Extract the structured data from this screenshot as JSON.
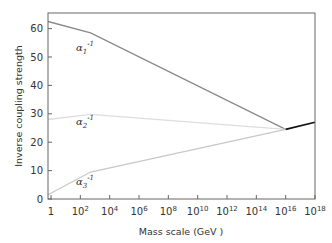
{
  "chart_data": {
    "type": "line",
    "title": "",
    "xlabel": "Mass scale (GeV )",
    "ylabel": "Inverse coupling strength",
    "xscale": "log10",
    "xlim_log10": [
      0,
      18
    ],
    "ylim": [
      0,
      65.5
    ],
    "x_ticks": [
      {
        "exp": 0,
        "label": "1",
        "sup": ""
      },
      {
        "exp": 2,
        "label": "10",
        "sup": "2"
      },
      {
        "exp": 4,
        "label": "10",
        "sup": "4"
      },
      {
        "exp": 6,
        "label": "10",
        "sup": "6"
      },
      {
        "exp": 8,
        "label": "10",
        "sup": "8"
      },
      {
        "exp": 10,
        "label": "10",
        "sup": "10"
      },
      {
        "exp": 12,
        "label": "10",
        "sup": "12"
      },
      {
        "exp": 14,
        "label": "10",
        "sup": "14"
      },
      {
        "exp": 16,
        "label": "10",
        "sup": "16"
      },
      {
        "exp": 18,
        "label": "10",
        "sup": "18"
      }
    ],
    "y_ticks": [
      0,
      10,
      20,
      30,
      40,
      50,
      60
    ],
    "grid": false,
    "legend": "inline labels",
    "series": [
      {
        "name": "alpha1_inverse",
        "label_base": "α",
        "label_sub": "1",
        "label_sup": "-1",
        "color": "#8a8a8a",
        "x_log10": [
          0,
          2.7,
          16
        ],
        "values": [
          62.5,
          58.5,
          24.5
        ],
        "label_pos": {
          "x_log10": 1.7,
          "y": 52
        }
      },
      {
        "name": "alpha2_inverse",
        "label_base": "α",
        "label_sub": "2",
        "label_sup": "-1",
        "color": "#dedede",
        "x_log10": [
          0,
          2.7,
          16
        ],
        "values": [
          28,
          29.8,
          24.5
        ],
        "label_pos": {
          "x_log10": 1.7,
          "y": 26
        }
      },
      {
        "name": "alpha3_inverse",
        "label_base": "α",
        "label_sub": "3",
        "label_sup": "-1",
        "color": "#c8c8c8",
        "x_log10": [
          0,
          2.7,
          16
        ],
        "values": [
          1.5,
          9.5,
          24.5
        ],
        "label_pos": {
          "x_log10": 1.7,
          "y": 5
        }
      },
      {
        "name": "unified",
        "color": "#111111",
        "x_log10": [
          16,
          18
        ],
        "values": [
          24.5,
          27
        ]
      }
    ]
  }
}
